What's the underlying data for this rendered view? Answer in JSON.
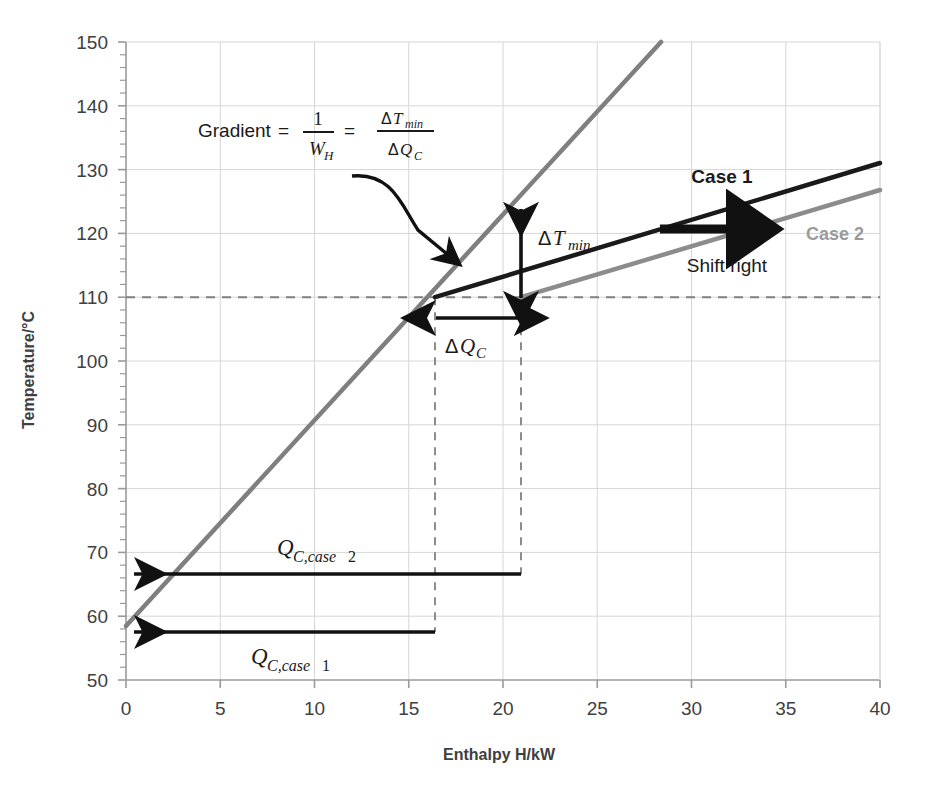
{
  "chart_data": {
    "type": "line",
    "title": "",
    "xlabel": "Enthalpy H/kW",
    "ylabel": "Temperature/°C",
    "xlim": [
      0,
      40
    ],
    "ylim": [
      50,
      150
    ],
    "xticks": [
      "0",
      "5",
      "10",
      "15",
      "20",
      "25",
      "30",
      "35",
      "40"
    ],
    "yticks": [
      "50",
      "60",
      "70",
      "80",
      "90",
      "100",
      "110",
      "120",
      "130",
      "140",
      "150"
    ],
    "xtick_values": [
      0,
      5,
      10,
      15,
      20,
      25,
      30,
      35,
      40
    ],
    "ytick_values": [
      50,
      60,
      70,
      80,
      90,
      100,
      110,
      120,
      130,
      140,
      150
    ],
    "grid": true,
    "minor_ticks_y_step": 2,
    "legend": "inline-labels",
    "series": [
      {
        "name": "Hot stream (steep)",
        "color": "#7f7f7f",
        "style": "solid",
        "width": 4,
        "points": [
          [
            0,
            58.5
          ],
          [
            28.4,
            150
          ]
        ]
      },
      {
        "name": "Case 1",
        "color": "#1a1a1a",
        "style": "solid",
        "width": 4,
        "points": [
          [
            16.4,
            110
          ],
          [
            40,
            131
          ]
        ]
      },
      {
        "name": "Case 2",
        "color": "#8c8c8c",
        "style": "solid",
        "width": 4,
        "points": [
          [
            20.7,
            110
          ],
          [
            40,
            127.3
          ]
        ]
      }
    ],
    "reference_lines": [
      {
        "name": "pinch-temperature",
        "type": "horizontal",
        "value": 110,
        "style": "dashed",
        "color": "#808080"
      },
      {
        "name": "case1-pinch-enthalpy",
        "type": "vertical",
        "value": 16.4,
        "from": 58.5,
        "to": 110,
        "style": "dashed",
        "color": "#808080"
      },
      {
        "name": "case2-pinch-enthalpy",
        "type": "vertical",
        "value": 20.7,
        "from": 67.5,
        "to": 110,
        "style": "dashed",
        "color": "#808080"
      }
    ],
    "annotations": [
      {
        "name": "gradient-formula",
        "text": "Gradient = 1/W_H = ΔT_min/ΔQ_C",
        "x": 11.5,
        "y": 133
      },
      {
        "name": "delta-t-min",
        "text": "ΔT_min",
        "x": 21.0,
        "y": 121,
        "value_range": [
          110,
          125.5
        ]
      },
      {
        "name": "delta-q-c",
        "text": "ΔQ_C",
        "x": 18.4,
        "y": 104,
        "value_range": [
          16.4,
          20.7
        ]
      },
      {
        "name": "case-1",
        "text": "Case 1",
        "x": 32.0,
        "y": 130
      },
      {
        "name": "case-2",
        "text": "Case 2",
        "x": 36.0,
        "y": 120
      },
      {
        "name": "shift-right",
        "text": "Shift right",
        "x": 31.5,
        "y": 115
      },
      {
        "name": "q-c-case-2",
        "text": "Q_C,case 2",
        "x": 9.5,
        "y": 71,
        "arrow_from": [
          20.7,
          67.5
        ],
        "arrow_to": [
          0,
          67.5
        ]
      },
      {
        "name": "q-c-case-1",
        "text": "Q_C,case 1",
        "x": 8.0,
        "y": 55.5,
        "arrow_from": [
          16.4,
          58.5
        ],
        "arrow_to": [
          0,
          58.5
        ]
      }
    ]
  },
  "labels": {
    "y_axis_title": "Temperature/°C",
    "x_axis_title": "Enthalpy H/kW",
    "case1": "Case 1",
    "case2": "Case 2",
    "shift_right": "Shift right",
    "gradient_word": "Gradient",
    "equals": "=",
    "one": "1",
    "w_sub": "W",
    "w_sub_h": "H",
    "delta": "Δ",
    "t_sym": "T",
    "t_sub": "min",
    "q_sym": "Q",
    "q_sub": "C",
    "delta_t_min_delta": "Δ",
    "delta_t_min_T": "T",
    "delta_t_min_sub": "min",
    "delta_q_c_delta": "Δ",
    "delta_q_c_Q": "Q",
    "delta_q_c_sub": "C",
    "qc_case2_Q": "Q",
    "qc_case2_sub": "C,case",
    "qc_case2_num": "2",
    "qc_case1_Q": "Q",
    "qc_case1_sub": "C,case",
    "qc_case1_num": "1"
  },
  "ticks": {
    "x": [
      "0",
      "5",
      "10",
      "15",
      "20",
      "25",
      "30",
      "35",
      "40"
    ],
    "y": [
      "150",
      "140",
      "130",
      "120",
      "110",
      "100",
      "90",
      "80",
      "70",
      "60",
      "50"
    ]
  },
  "colors": {
    "hot_line": "#7f7f7f",
    "case1_line": "#1a1a1a",
    "case2_line": "#8c8c8c",
    "grid": "#d4d4d4",
    "axis": "#9a9a9a",
    "dashed": "#808080",
    "text": "#404040",
    "background": "#ffffff"
  }
}
